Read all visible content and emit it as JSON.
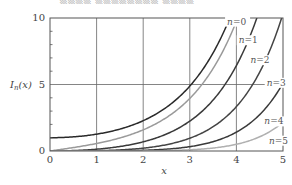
{
  "top_cutoff_text": "▒▒▒▒ ▒▒▒▒▒▒▒▒ ▒▒▒▒",
  "chart_data": {
    "type": "line",
    "title": "",
    "xlabel": "x",
    "ylabel": "I_n(x)",
    "xlim": [
      0,
      5
    ],
    "ylim": [
      0,
      10
    ],
    "grid": true,
    "x_ticks": [
      0,
      1,
      2,
      3,
      4,
      5
    ],
    "y_ticks": [
      0,
      5,
      10
    ],
    "x": [
      0,
      0.5,
      1,
      1.5,
      2,
      2.5,
      3,
      3.5,
      4,
      4.5,
      5
    ],
    "series": [
      {
        "name": "n=0",
        "color": "#2a2a2a",
        "values": [
          1.0,
          1.063,
          1.266,
          1.647,
          2.28,
          3.29,
          4.881,
          7.378,
          11.302,
          17.481,
          27.24
        ]
      },
      {
        "name": "n=1",
        "color": "#9a9a9a",
        "values": [
          0.0,
          0.258,
          0.565,
          0.982,
          1.591,
          2.517,
          3.953,
          6.206,
          9.759,
          15.389,
          24.336
        ]
      },
      {
        "name": "n=2",
        "color": "#3a3a3a",
        "values": [
          0.0,
          0.032,
          0.136,
          0.338,
          0.689,
          1.276,
          2.245,
          3.832,
          6.422,
          10.641,
          17.506
        ]
      },
      {
        "name": "n=3",
        "color": "#444444",
        "values": [
          0.0,
          0.003,
          0.022,
          0.081,
          0.213,
          0.474,
          0.96,
          1.829,
          3.337,
          5.907,
          10.331
        ]
      },
      {
        "name": "n=4",
        "color": "#3a3a3a",
        "values": [
          0.0,
          0.0002,
          0.0027,
          0.0148,
          0.0507,
          0.1383,
          0.3257,
          0.6985,
          1.4163,
          2.7142,
          5.1082
        ]
      },
      {
        "name": "n=5",
        "color": "#b0b0b0",
        "values": [
          0.0,
          0.0,
          0.0003,
          0.0022,
          0.0098,
          0.0332,
          0.0912,
          0.2191,
          0.5047,
          1.0501,
          2.1574
        ]
      }
    ],
    "annotations": [
      {
        "text": "n=0",
        "x": 3.8,
        "y": 9.5
      },
      {
        "text": "n=1",
        "x": 4.05,
        "y": 8.1
      },
      {
        "text": "n=2",
        "x": 4.3,
        "y": 6.6
      },
      {
        "text": "n=3",
        "x": 4.65,
        "y": 4.9
      },
      {
        "text": "n=4",
        "x": 4.6,
        "y": 2.0
      },
      {
        "text": "n=5",
        "x": 4.7,
        "y": 0.55
      }
    ]
  }
}
